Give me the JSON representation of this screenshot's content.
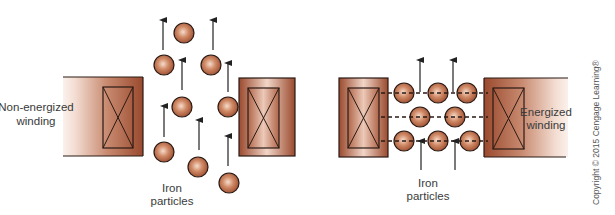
{
  "colors": {
    "copper_dark": "#9a4a2e",
    "copper_light": "#f6e6de",
    "particle_mid": "#c7714d",
    "outline": "#2a1a14",
    "text": "#3a3a3a",
    "dash": "#2a1a14"
  },
  "left_panel": {
    "winding_label_line1": "Non-energized",
    "winding_label_line2": "winding",
    "particles_label_line1": "Iron",
    "particles_label_line2": "particles",
    "state": "non-energized",
    "particles": [
      {
        "cx": 164,
        "cy": 65
      },
      {
        "cx": 184,
        "cy": 33
      },
      {
        "cx": 211,
        "cy": 65
      },
      {
        "cx": 182,
        "cy": 107
      },
      {
        "cx": 228,
        "cy": 107
      },
      {
        "cx": 164,
        "cy": 152
      },
      {
        "cx": 198,
        "cy": 167
      },
      {
        "cx": 229,
        "cy": 183
      }
    ],
    "arrows": [
      {
        "x": 163,
        "y1": 50,
        "y2": 20
      },
      {
        "x": 213,
        "y1": 50,
        "y2": 20
      },
      {
        "x": 182,
        "y1": 90,
        "y2": 60
      },
      {
        "x": 228,
        "y1": 92,
        "y2": 63
      },
      {
        "x": 164,
        "y1": 137,
        "y2": 106
      },
      {
        "x": 199,
        "y1": 150,
        "y2": 120
      },
      {
        "x": 228,
        "y1": 166,
        "y2": 136
      }
    ]
  },
  "right_panel": {
    "winding_label_line1": "Energized",
    "winding_label_line2": "winding",
    "particles_label_line1": "Iron",
    "particles_label_line2": "particles",
    "state": "energized",
    "particles": [
      {
        "cx": 404,
        "cy": 93
      },
      {
        "cx": 438,
        "cy": 93
      },
      {
        "cx": 467,
        "cy": 93
      },
      {
        "cx": 420,
        "cy": 117
      },
      {
        "cx": 455,
        "cy": 117
      },
      {
        "cx": 404,
        "cy": 141
      },
      {
        "cx": 438,
        "cy": 141
      },
      {
        "cx": 470,
        "cy": 141
      }
    ],
    "field_lines_y": [
      93,
      117,
      141
    ],
    "arrows": [
      {
        "x": 420,
        "y1": 92,
        "y2": 60
      },
      {
        "x": 453,
        "y1": 92,
        "y2": 60
      },
      {
        "x": 421,
        "y1": 170,
        "y2": 141
      },
      {
        "x": 455,
        "y1": 170,
        "y2": 141
      }
    ]
  },
  "copyright": "Copyright © 2015 Cengage Learning®"
}
